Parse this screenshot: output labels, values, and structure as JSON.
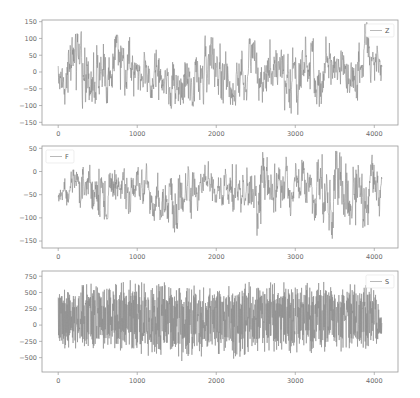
{
  "chart_data": [
    {
      "type": "line",
      "title": "",
      "xlabel": "",
      "ylabel": "",
      "legend": [
        "Z"
      ],
      "legend_position": "upper right",
      "grid": false,
      "xlim": [
        -205,
        4300
      ],
      "ylim": [
        -158,
        155
      ],
      "xticks": [
        0,
        1000,
        2000,
        3000,
        4000
      ],
      "xtick_labels": [
        "0",
        "1000",
        "2000",
        "3000",
        "4000"
      ],
      "yticks": [
        -150,
        -100,
        -50,
        0,
        50,
        100,
        150
      ],
      "ytick_labels": [
        "−150",
        "−100",
        "−50",
        "0",
        "50",
        "100",
        "150"
      ],
      "series": [
        {
          "name": "Z",
          "color": "#8a8a8a",
          "n_points": 4097,
          "x_range": [
            0,
            4096
          ],
          "approx_mean": 0,
          "approx_range": [
            -135,
            150
          ],
          "sampled_envelope": {
            "x": [
              0,
              250,
              500,
              750,
              1000,
              1250,
              1500,
              1750,
              2000,
              2250,
              2500,
              2750,
              3000,
              3250,
              3500,
              3750,
              3900,
              4096
            ],
            "max": [
              65,
              120,
              125,
              110,
              100,
              80,
              90,
              115,
              100,
              110,
              95,
              100,
              110,
              100,
              110,
              90,
              150,
              60
            ],
            "min": [
              -80,
              -130,
              -100,
              -85,
              -70,
              -80,
              -120,
              -100,
              -90,
              -100,
              -95,
              -100,
              -130,
              -110,
              -80,
              -90,
              -70,
              -50
            ]
          }
        }
      ]
    },
    {
      "type": "line",
      "title": "",
      "xlabel": "",
      "ylabel": "",
      "legend": [
        "F"
      ],
      "legend_position": "upper left",
      "grid": false,
      "xlim": [
        -205,
        4300
      ],
      "ylim": [
        -165,
        55
      ],
      "xticks": [
        0,
        1000,
        2000,
        3000,
        4000
      ],
      "xtick_labels": [
        "0",
        "1000",
        "2000",
        "3000",
        "4000"
      ],
      "yticks": [
        -150,
        -100,
        -50,
        0,
        50
      ],
      "ytick_labels": [
        "−150",
        "−100",
        "−50",
        "0",
        "50"
      ],
      "series": [
        {
          "name": "F",
          "color": "#8a8a8a",
          "n_points": 4097,
          "x_range": [
            0,
            4096
          ],
          "approx_mean": -30,
          "approx_range": [
            -150,
            48
          ],
          "sampled_envelope": {
            "x": [
              0,
              250,
              500,
              750,
              1000,
              1250,
              1500,
              1750,
              2000,
              2250,
              2500,
              2750,
              3000,
              3250,
              3500,
              3750,
              4000,
              4096
            ],
            "max": [
              -20,
              20,
              30,
              25,
              15,
              20,
              35,
              25,
              20,
              15,
              40,
              45,
              20,
              35,
              45,
              30,
              45,
              40
            ],
            "min": [
              -80,
              -90,
              -105,
              -100,
              -85,
              -110,
              -135,
              -90,
              -95,
              -85,
              -140,
              -115,
              -90,
              -110,
              -150,
              -115,
              -130,
              -80
            ]
          }
        }
      ]
    },
    {
      "type": "line",
      "title": "",
      "xlabel": "",
      "ylabel": "",
      "legend": [
        "S"
      ],
      "legend_position": "upper right",
      "grid": false,
      "xlim": [
        -205,
        4300
      ],
      "ylim": [
        -720,
        830
      ],
      "xticks": [
        0,
        1000,
        2000,
        3000,
        4000
      ],
      "xtick_labels": [
        "0",
        "1000",
        "2000",
        "3000",
        "4000"
      ],
      "yticks": [
        -500,
        -250,
        0,
        250,
        500,
        750
      ],
      "ytick_labels": [
        "−500",
        "−250",
        "0",
        "250",
        "500",
        "750"
      ],
      "series": [
        {
          "name": "S",
          "color": "#8a8a8a",
          "n_points": 4097,
          "x_range": [
            0,
            4096
          ],
          "approx_mean": 0,
          "approx_range": [
            -600,
            780
          ],
          "sampled_envelope": {
            "x": [
              0,
              250,
              500,
              750,
              1000,
              1250,
              1500,
              1750,
              2000,
              2250,
              2500,
              2750,
              3000,
              3250,
              3500,
              3750,
              4000,
              4096
            ],
            "max": [
              650,
              700,
              650,
              720,
              750,
              700,
              720,
              650,
              650,
              700,
              680,
              720,
              700,
              720,
              650,
              700,
              650,
              100
            ],
            "min": [
              -400,
              -450,
              -400,
              -450,
              -500,
              -550,
              -600,
              -550,
              -500,
              -550,
              -450,
              -500,
              -550,
              -450,
              -450,
              -450,
              -450,
              -150
            ]
          }
        }
      ]
    }
  ],
  "figure": {
    "width": 420,
    "height": 398,
    "panels": [
      {
        "legend_label": "Z"
      },
      {
        "legend_label": "F"
      },
      {
        "legend_label": "S"
      }
    ]
  }
}
